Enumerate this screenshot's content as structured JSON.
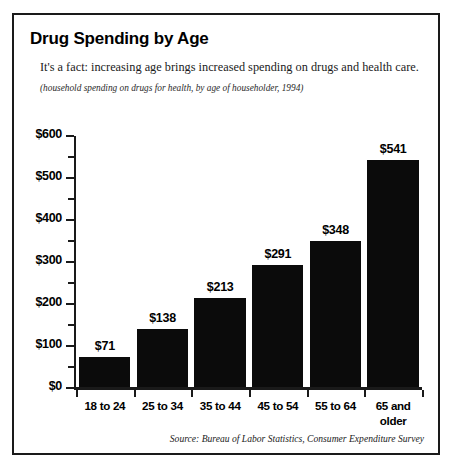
{
  "figure": {
    "title": "Drug Spending by Age",
    "subtitle": "It's a fact: increasing age brings increased spending on drugs and health care.",
    "note": "(household spending on drugs for health, by age of householder, 1994)",
    "source": "Source: Bureau of Labor Statistics, Consumer Expenditure Survey",
    "frame_color": "#1a1a1a",
    "bar_color": "#0b0b0b",
    "background": "#ffffff"
  },
  "chart_data": {
    "type": "bar",
    "title": "Drug Spending by Age",
    "subtitle": "It's a fact: increasing age brings increased spending on drugs and health care.",
    "note": "(household spending on drugs for health, by age of householder, 1994)",
    "source": "Source: Bureau of Labor Statistics, Consumer Expenditure Survey",
    "xlabel": "",
    "ylabel": "",
    "categories": [
      "18 to 24",
      "25 to 34",
      "35 to 44",
      "45 to 54",
      "55 to 64",
      "65 and older"
    ],
    "values": [
      71,
      138,
      213,
      291,
      348,
      541
    ],
    "data_labels": [
      "$71",
      "$138",
      "$213",
      "$291",
      "$348",
      "$541"
    ],
    "ylim": [
      0,
      600
    ],
    "ytick_values": [
      0,
      100,
      200,
      300,
      400,
      500,
      600
    ],
    "ytick_labels": [
      "$0",
      "$100",
      "$200",
      "$300",
      "$400",
      "$500",
      "$600"
    ],
    "yminor_values": [
      50,
      150,
      250,
      350,
      450,
      550
    ],
    "grid": false,
    "legend": null,
    "bar_color": "#0b0b0b"
  }
}
